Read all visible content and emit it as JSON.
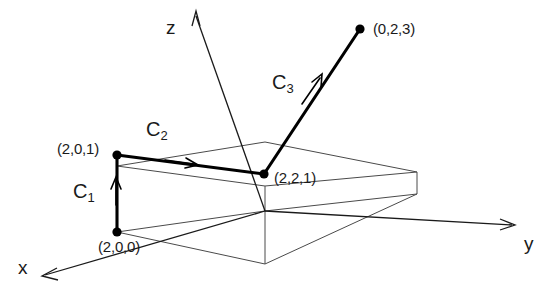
{
  "figure": {
    "type": "diagram",
    "background_color": "#ffffff",
    "line_color": "#000000",
    "box_color": "#4a4a4a",
    "axes": [
      {
        "name": "x",
        "label": "x",
        "direction": "down-left"
      },
      {
        "name": "y",
        "label": "y",
        "direction": "right"
      },
      {
        "name": "z",
        "label": "z",
        "direction": "up"
      }
    ],
    "points": [
      {
        "id": "p1",
        "label": "(2,0,0)",
        "coords": [
          2,
          0,
          0
        ]
      },
      {
        "id": "p2",
        "label": "(2,0,1)",
        "coords": [
          2,
          0,
          1
        ]
      },
      {
        "id": "p3",
        "label": "(2,2,1)",
        "coords": [
          2,
          2,
          1
        ]
      },
      {
        "id": "p4",
        "label": "(0,2,3)",
        "coords": [
          0,
          2,
          3
        ]
      }
    ],
    "curves": [
      {
        "id": "c1",
        "label": "C",
        "subscript": "1",
        "from": "(2,0,0)",
        "to": "(2,0,1)"
      },
      {
        "id": "c2",
        "label": "C",
        "subscript": "2",
        "from": "(2,0,1)",
        "to": "(2,2,1)"
      },
      {
        "id": "c3",
        "label": "C",
        "subscript": "3",
        "from": "(2,2,1)",
        "to": "(0,2,3)"
      }
    ]
  }
}
